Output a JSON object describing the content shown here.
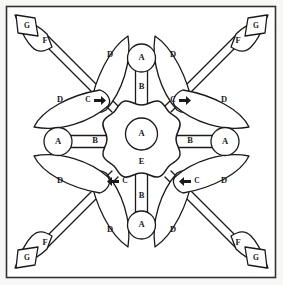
{
  "figure": {
    "background_color": "#f7f7f5",
    "line_color": "#1a1a1a",
    "fill_color": "#ffffff",
    "border": {
      "color": "#333333",
      "inset_px": 6,
      "stroke_px": 1.5
    }
  },
  "labels": {
    "center_hub": "A",
    "center_body": "E",
    "top_node": "A",
    "bottom_node": "A",
    "left_node": "A",
    "right_node": "A",
    "stem_top": "B",
    "stem_bottom": "B",
    "stem_left": "B",
    "stem_right": "B",
    "callout_top_left": "C",
    "callout_top_right": "C",
    "callout_bottom_left": "C",
    "callout_bottom_right": "C",
    "leaf": "D",
    "arrowhead": "F",
    "flag": "G"
  },
  "parts_list": [
    {
      "key": "A",
      "count": 5,
      "shape": "circle-node"
    },
    {
      "key": "B",
      "count": 4,
      "shape": "rectangular-stem"
    },
    {
      "key": "C",
      "count": 4,
      "shape": "callout-arrow"
    },
    {
      "key": "D",
      "count": 8,
      "shape": "leaf"
    },
    {
      "key": "E",
      "count": 1,
      "shape": "scalloped-hub"
    },
    {
      "key": "F",
      "count": 4,
      "shape": "arrowhead"
    },
    {
      "key": "G",
      "count": 4,
      "shape": "flag-quad"
    }
  ],
  "leaves": [
    {
      "id": "leaf-top-left-inner",
      "label": "D"
    },
    {
      "id": "leaf-top-left-outer",
      "label": "D"
    },
    {
      "id": "leaf-top-right-inner",
      "label": "D"
    },
    {
      "id": "leaf-top-right-outer",
      "label": "D"
    },
    {
      "id": "leaf-bottom-left-inner",
      "label": "D"
    },
    {
      "id": "leaf-bottom-left-outer",
      "label": "D"
    },
    {
      "id": "leaf-bottom-right-inner",
      "label": "D"
    },
    {
      "id": "leaf-bottom-right-outer",
      "label": "D"
    }
  ],
  "arms": [
    {
      "id": "arm-top-left",
      "arrowhead": "F",
      "flag": "G"
    },
    {
      "id": "arm-top-right",
      "arrowhead": "F",
      "flag": "G"
    },
    {
      "id": "arm-bottom-left",
      "arrowhead": "F",
      "flag": "G"
    },
    {
      "id": "arm-bottom-right",
      "arrowhead": "F",
      "flag": "G"
    }
  ]
}
